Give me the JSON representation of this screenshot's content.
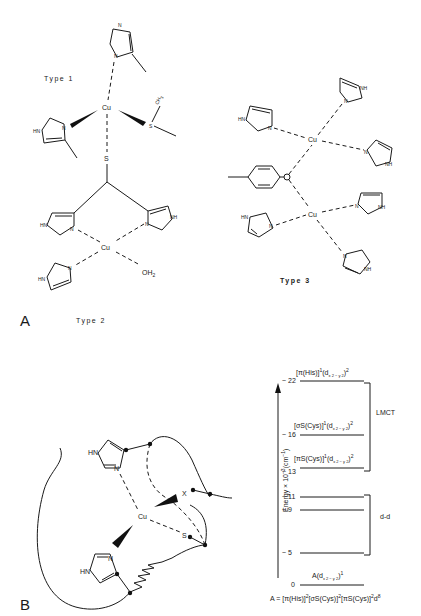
{
  "panel_a": {
    "label": "A",
    "type1": {
      "title": "Type 1",
      "metal": "Cu",
      "ligands": [
        "N",
        "N",
        "HN",
        "N",
        "S",
        "CH3"
      ],
      "ch3": "CH",
      "ch3_sub": "3",
      "s_top": "S",
      "hn": "HN",
      "n": "N",
      "s_thioether": "S"
    },
    "type2": {
      "title": "Type 2",
      "metal": "Cu",
      "hn_left": "HN",
      "n_left": "N",
      "nh_right": "NH",
      "n_right": "N",
      "hn_bottom": "HN",
      "n_bottom": "N",
      "water": "OH",
      "water_sub": "2"
    },
    "type3": {
      "title": "Type 3",
      "metal_top": "Cu",
      "metal_bottom": "Cu",
      "bridge": "O",
      "hn": "HN",
      "nh": "NH",
      "n": "N"
    }
  },
  "panel_b": {
    "label": "B",
    "site": {
      "metal": "Cu",
      "hn_top": "HN",
      "n_top": "N",
      "hn_bottom": "HN",
      "n_bottom": "N",
      "s": "S",
      "x": "X"
    },
    "energy_diagram": {
      "axis_label": "Energy × 10",
      "axis_exp": "−3",
      "axis_unit": "(cm",
      "axis_unit_exp": "−1",
      "axis_unit_close": ")",
      "levels": [
        {
          "value": "~ 22",
          "label": "[π(His)]",
          "label_sup": "1",
          "label_d": "(d",
          "label_dsub": "x 2 − y 2",
          "label_close": ")",
          "label_close_sup": "2"
        },
        {
          "value": "~ 16",
          "label": "[σS(Cys)]",
          "label_sup": "1",
          "label_d": "(d",
          "label_dsub": "x 2 − y 2",
          "label_close": ")",
          "label_close_sup": "2"
        },
        {
          "value": "~ 13",
          "label": "[πS(Cys)]",
          "label_sup": "1",
          "label_d": "(d",
          "label_dsub": "x 2 − y 2",
          "label_close": ")",
          "label_close_sup": "2"
        },
        {
          "value": "~ 11",
          "label": ""
        },
        {
          "value": "~ 9",
          "label": ""
        },
        {
          "value": "~ 5",
          "label": ""
        },
        {
          "value": "0",
          "label": "A(d",
          "label_dsub": "x 2 − y 2",
          "label_close": ")",
          "label_close_sup": "1"
        }
      ],
      "group_lmct": "LMCT",
      "group_dd": "d-d",
      "ground_state_formula": {
        "prefix": "A = [π(His)]",
        "s1": "2",
        "p2": "[σS(Cys)]",
        "s2": "2",
        "p3": "[πS(Cys)]",
        "s3": "2",
        "p4": "d",
        "s4": "8"
      }
    }
  }
}
